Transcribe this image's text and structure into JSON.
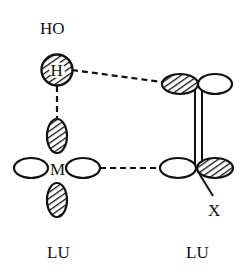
{
  "diagram": {
    "labels": {
      "top_group": "HO",
      "h_atom": "H",
      "metal_atom": "M",
      "x_atom": "X",
      "left_unit": "LU",
      "right_unit": "LU"
    },
    "colors": {
      "stroke": "#111111",
      "hatch": "#111111",
      "background": "#ffffff"
    }
  }
}
